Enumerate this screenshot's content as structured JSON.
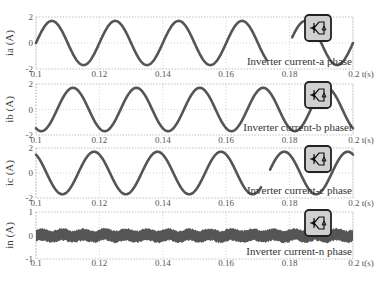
{
  "figure": {
    "x_axis_label": "t(s)",
    "x_ticks": [
      "0.1",
      "0.12",
      "0.14",
      "0.16",
      "0.18",
      "0.2"
    ],
    "grid": "dotted"
  },
  "chart_data": [
    {
      "type": "line",
      "ylabel": "ia (A)",
      "xlabel": "t(s)",
      "xlim": [
        0.1,
        0.2
      ],
      "ylim": [
        -2,
        2
      ],
      "y_ticks": [
        "-2",
        "0",
        "2"
      ],
      "x_ticks": [
        0.1,
        0.12,
        0.14,
        0.16,
        0.18,
        0.2
      ],
      "legend": "Inverter current-a phase",
      "series": [
        {
          "name": "ia",
          "waveform": "sine",
          "frequency_hz": 50,
          "amplitude": 1.7,
          "phase_deg": 0
        }
      ]
    },
    {
      "type": "line",
      "ylabel": "ib (A)",
      "xlabel": "t(s)",
      "xlim": [
        0.1,
        0.2
      ],
      "ylim": [
        -2,
        2
      ],
      "y_ticks": [
        "-2",
        "0",
        "2"
      ],
      "x_ticks": [
        0.1,
        0.12,
        0.14,
        0.16,
        0.18,
        0.2
      ],
      "legend": "Inverter current-b phaset",
      "series": [
        {
          "name": "ib",
          "waveform": "sine",
          "frequency_hz": 50,
          "amplitude": 1.7,
          "phase_deg": -120
        }
      ]
    },
    {
      "type": "line",
      "ylabel": "ic (A)",
      "xlabel": "t(s)",
      "xlim": [
        0.1,
        0.2
      ],
      "ylim": [
        -2,
        2
      ],
      "y_ticks": [
        "-2",
        "0",
        "2"
      ],
      "x_ticks": [
        0.1,
        0.12,
        0.14,
        0.16,
        0.18,
        0.2
      ],
      "legend": "Inverter current-c phase",
      "series": [
        {
          "name": "ic",
          "waveform": "sine",
          "frequency_hz": 50,
          "amplitude": 1.7,
          "phase_deg": 120
        }
      ]
    },
    {
      "type": "line",
      "ylabel": "in (A)",
      "xlabel": "t(s)",
      "xlim": [
        0.1,
        0.2
      ],
      "ylim": [
        -1,
        1
      ],
      "y_ticks": [
        "-1",
        "0",
        "1"
      ],
      "x_ticks": [
        0.1,
        0.12,
        0.14,
        0.16,
        0.18,
        0.2
      ],
      "legend": "Inverter current-n phase",
      "series": [
        {
          "name": "in",
          "waveform": "noise",
          "mean": 0,
          "band": [
            -0.25,
            0.25
          ],
          "ripple_frequency_hz": 150
        }
      ]
    }
  ],
  "panels": [
    {
      "ylabel": "ia (A)",
      "ytop": "2",
      "ymid": "0",
      "ybot": "-2",
      "legend": "Inverter current-a phase"
    },
    {
      "ylabel": "ib (A)",
      "ytop": "2",
      "ymid": "0",
      "ybot": "-2",
      "legend": "Inverter current-b phaset"
    },
    {
      "ylabel": "ic (A)",
      "ytop": "2",
      "ymid": "0",
      "ybot": "-2",
      "legend": "Inverter current-c phase"
    },
    {
      "ylabel": "in (A)",
      "ytop": "1",
      "ymid": "0",
      "ybot": "-1",
      "legend": "Inverter current-n phase"
    }
  ],
  "colors": {
    "trace": "#555555",
    "grid": "#bbbbbb",
    "frame": "#999999",
    "icon_bg": "#d0d0d0",
    "icon_border": "#222222"
  }
}
